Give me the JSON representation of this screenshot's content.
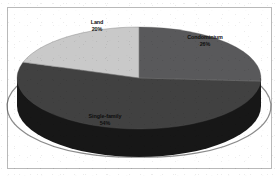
{
  "chart_data": {
    "type": "pie",
    "title": "",
    "subtitle": "",
    "xlabel": "",
    "ylabel": "",
    "legend_position": "none",
    "grid": false,
    "three_d": true,
    "categories": [
      "Condominium",
      "Single-family",
      "Land"
    ],
    "values": [
      26,
      54,
      20
    ],
    "unit": "%",
    "slices": [
      {
        "label": "Condominium",
        "value": 26,
        "pct_text": "26%",
        "color": "#59595b",
        "start_angle_deg": 0,
        "end_angle_deg": 93.6
      },
      {
        "label": "Single-family",
        "value": 54,
        "pct_text": "54%",
        "color": "#414141",
        "start_angle_deg": 93.6,
        "end_angle_deg": 288.0
      },
      {
        "label": "Land",
        "value": 20,
        "pct_text": "20%",
        "color": "#c9c9c9",
        "start_angle_deg": 288.0,
        "end_angle_deg": 360.0
      }
    ]
  },
  "labels": {
    "land": {
      "name": "Land",
      "pct": "20%"
    },
    "condominium": {
      "name": "Condominium",
      "pct": "26%"
    },
    "single_family": {
      "name": "Single-family",
      "pct": "54%"
    }
  },
  "colors": {
    "land": "#c9c9c9",
    "condominium": "#59595b",
    "single_family": "#414141",
    "side_wall": "#171717",
    "side_wall_light": "#2b2b2b",
    "panel_background": "#ffffff",
    "frame_border": "#b9b9b9",
    "label_text": "#111111"
  }
}
